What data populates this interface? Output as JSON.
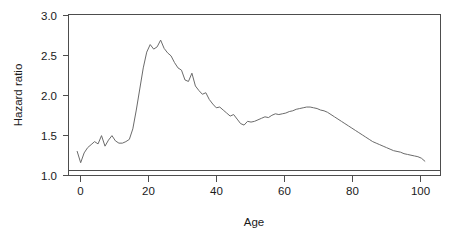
{
  "chart_data": {
    "type": "line",
    "title": "",
    "subtitle": "",
    "xlabel": "Age",
    "ylabel": "Hazard ratio",
    "xlim": [
      -2.5,
      104.5
    ],
    "ylim": [
      0.93,
      3.07
    ],
    "xticks": [
      0,
      20,
      40,
      60,
      80,
      100
    ],
    "xtick_labels": [
      "0",
      "20",
      "40",
      "60",
      "80",
      "100"
    ],
    "yticks": [
      1.0,
      1.5,
      2.0,
      2.5,
      3.0
    ],
    "ytick_labels": [
      "1.0",
      "1.5",
      "2.0",
      "2.5",
      "3.0"
    ],
    "grid": false,
    "legend": null,
    "legend_position": "none",
    "box": true,
    "annotations": [
      {
        "label": "reference line at hazard ratio 1.0",
        "y": 1.0
      }
    ],
    "reference_lines": [
      {
        "orientation": "horizontal",
        "value": 1.0,
        "color": "#4d4d4d"
      }
    ],
    "series": [
      {
        "name": "Hazard ratio",
        "color": "#6b6b6b",
        "x": [
          0,
          1,
          2,
          3,
          4,
          5,
          6,
          7,
          8,
          9,
          10,
          11,
          12,
          13,
          14,
          15,
          16,
          17,
          18,
          19,
          20,
          21,
          22,
          23,
          24,
          25,
          26,
          27,
          28,
          29,
          30,
          31,
          32,
          33,
          34,
          35,
          36,
          37,
          38,
          39,
          40,
          41,
          42,
          43,
          44,
          45,
          46,
          47,
          48,
          49,
          50,
          51,
          52,
          53,
          54,
          55,
          56,
          57,
          58,
          59,
          60,
          61,
          62,
          63,
          64,
          65,
          66,
          67,
          68,
          69,
          70,
          71,
          72,
          73,
          74,
          75,
          76,
          77,
          78,
          79,
          80,
          81,
          82,
          83,
          84,
          85,
          86,
          87,
          88,
          89,
          90,
          91,
          92,
          93,
          94,
          95,
          96,
          97,
          98,
          99,
          100
        ],
        "y": [
          1.25,
          1.1,
          1.23,
          1.3,
          1.34,
          1.38,
          1.35,
          1.46,
          1.32,
          1.4,
          1.46,
          1.39,
          1.36,
          1.36,
          1.38,
          1.41,
          1.55,
          1.8,
          2.08,
          2.36,
          2.57,
          2.67,
          2.61,
          2.64,
          2.73,
          2.62,
          2.56,
          2.52,
          2.43,
          2.36,
          2.33,
          2.2,
          2.18,
          2.29,
          2.12,
          2.06,
          2.01,
          2.03,
          1.94,
          1.88,
          1.83,
          1.84,
          1.8,
          1.76,
          1.72,
          1.74,
          1.68,
          1.62,
          1.6,
          1.65,
          1.64,
          1.65,
          1.67,
          1.69,
          1.71,
          1.7,
          1.73,
          1.75,
          1.74,
          1.75,
          1.76,
          1.78,
          1.79,
          1.81,
          1.82,
          1.83,
          1.84,
          1.84,
          1.83,
          1.82,
          1.8,
          1.79,
          1.77,
          1.74,
          1.71,
          1.68,
          1.65,
          1.62,
          1.59,
          1.56,
          1.53,
          1.5,
          1.47,
          1.44,
          1.41,
          1.38,
          1.36,
          1.34,
          1.32,
          1.3,
          1.28,
          1.26,
          1.25,
          1.24,
          1.22,
          1.21,
          1.2,
          1.19,
          1.18,
          1.16,
          1.12
        ]
      }
    ]
  },
  "figure": {
    "background_color": "#ffffff",
    "axis_color": "#4d4d4d",
    "curve_color": "#6b6b6b",
    "text_color": "#1a1a1a"
  }
}
